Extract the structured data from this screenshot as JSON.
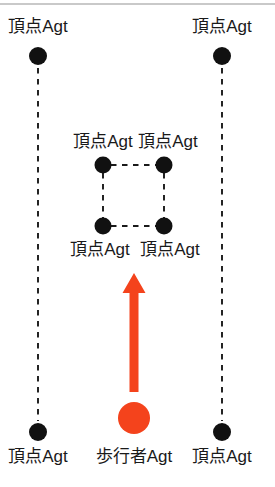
{
  "figure": {
    "title_line_color": "#c9c9c9",
    "background": "#ffffff",
    "node_color": "#111111",
    "pedestrian_color": "#f4431c",
    "dash_color": "#1a1a1a"
  },
  "labels": {
    "vertex_agent": "頂点Agt",
    "pedestrian_agent": "歩行者Agt"
  },
  "nodes": [
    {
      "id": "outer-top-left",
      "label": "頂点Agt",
      "cx": 38,
      "cy": 56,
      "r": 9,
      "label_x": 38,
      "label_y": 32,
      "anchor": "middle"
    },
    {
      "id": "outer-top-right",
      "label": "頂点Agt",
      "cx": 222,
      "cy": 56,
      "r": 9,
      "label_x": 222,
      "label_y": 32,
      "anchor": "middle"
    },
    {
      "id": "inner-top-left",
      "label": "頂点Agt",
      "cx": 103,
      "cy": 165,
      "r": 8.5,
      "label_x": 103,
      "label_y": 147,
      "anchor": "middle"
    },
    {
      "id": "inner-top-right",
      "label": "頂点Agt",
      "cx": 164,
      "cy": 165,
      "r": 8.5,
      "label_x": 168,
      "label_y": 147,
      "anchor": "middle"
    },
    {
      "id": "inner-bottom-left",
      "label": "頂点Agt",
      "cx": 103,
      "cy": 226,
      "r": 8.5,
      "label_x": 100,
      "label_y": 255,
      "anchor": "middle"
    },
    {
      "id": "inner-bottom-right",
      "label": "頂点Agt",
      "cx": 164,
      "cy": 226,
      "r": 8.5,
      "label_x": 170,
      "label_y": 255,
      "anchor": "middle"
    },
    {
      "id": "outer-bottom-left",
      "label": "頂点Agt",
      "cx": 38,
      "cy": 432,
      "r": 9,
      "label_x": 38,
      "label_y": 462,
      "anchor": "middle"
    },
    {
      "id": "outer-bottom-right",
      "label": "頂点Agt",
      "cx": 222,
      "cy": 432,
      "r": 9,
      "label_x": 222,
      "label_y": 462,
      "anchor": "middle"
    }
  ],
  "pedestrian": {
    "label": "歩行者Agt",
    "cx": 134,
    "cy": 418,
    "r": 16,
    "label_x": 134,
    "label_y": 462,
    "color": "#f4431c"
  },
  "arrow": {
    "x": 134,
    "tail_y": 392,
    "tip_y": 273,
    "shaft_width": 9,
    "head_width": 23,
    "head_height": 20,
    "color": "#f4431c"
  },
  "dashed_edges": [
    {
      "id": "left-rail",
      "x1": 38,
      "y1": 68,
      "x2": 38,
      "y2": 421
    },
    {
      "id": "right-rail",
      "x1": 222,
      "y1": 68,
      "x2": 222,
      "y2": 421
    },
    {
      "id": "inner-top",
      "x1": 111,
      "y1": 165,
      "x2": 156,
      "y2": 165
    },
    {
      "id": "inner-bottom",
      "x1": 111,
      "y1": 226,
      "x2": 156,
      "y2": 226
    },
    {
      "id": "inner-left",
      "x1": 103,
      "y1": 173,
      "x2": 103,
      "y2": 218
    },
    {
      "id": "inner-right",
      "x1": 164,
      "y1": 173,
      "x2": 164,
      "y2": 218
    }
  ],
  "top_rule": {
    "y": 4,
    "x1": 0,
    "x2": 275
  }
}
